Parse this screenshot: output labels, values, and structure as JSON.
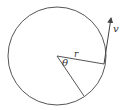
{
  "diagram": {
    "type": "circular-motion",
    "circle": {
      "cx": 57,
      "cy": 56,
      "r": 49,
      "stroke": "#555555"
    },
    "radius_line": {
      "x1": 57,
      "y1": 56,
      "x2": 104,
      "y2": 64
    },
    "second_radius": {
      "x1": 57,
      "y1": 56,
      "x2": 84,
      "y2": 96
    },
    "velocity_vector": {
      "x1": 104,
      "y1": 64,
      "x2": 112,
      "y2": 16
    },
    "labels": {
      "radius": "r",
      "angle": "θ",
      "velocity": "v"
    }
  }
}
